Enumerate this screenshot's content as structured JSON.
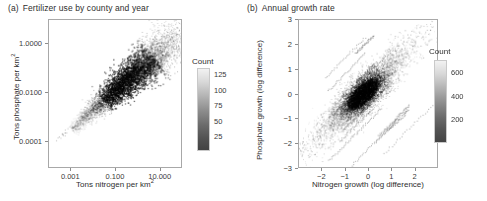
{
  "figure": {
    "width": 487,
    "height": 201,
    "background": "#ffffff",
    "ink": "#3a3a3a"
  },
  "chart_data": [
    {
      "type": "scatter",
      "panel": "a",
      "panel_tag": "(a)",
      "title": "Fertilizer use by county and year",
      "xlabel_prefix": "Tons nitrogen per km",
      "xlabel_sup": "2",
      "ylabel_prefix": "Tons phosphate per km",
      "ylabel_sup": "2",
      "xscale": "log",
      "yscale": "log",
      "xlim": [
        0.0001,
        100.0
      ],
      "ylim": [
        8e-06,
        10.0
      ],
      "xticks": [
        0.001,
        0.1,
        10.0
      ],
      "xticklabels": [
        "0.001",
        "0.100",
        "10.000"
      ],
      "yticks": [
        1.0,
        0.01,
        0.0001
      ],
      "yticklabels": [
        "1.0000",
        "0.0100",
        "0.0001"
      ],
      "grid": false,
      "legend": {
        "title": "Count",
        "position": "right",
        "ticks": [
          125,
          100,
          75,
          50,
          25
        ],
        "ticklabels": [
          "125",
          "100",
          "75",
          "50",
          "25"
        ],
        "cmin": 1,
        "cmax": 135,
        "colormap": "grey-light-to-dark"
      },
      "description": "Dense elongated point cloud along the 1:1 diagonal running from the lower-left to the upper-right of the log-log panel, widest near the upper-right, with sparse outlier streaks below the main band.",
      "cloud": {
        "x_center_frac": 0.6,
        "y_center_frac": 0.4,
        "angle_deg": -42,
        "length_frac": 1.05,
        "width_frac": 0.16,
        "n_points": 5200
      }
    },
    {
      "type": "scatter",
      "panel": "b",
      "panel_tag": "(b)",
      "title": "Annual growth rate",
      "xlabel": "Nitrogen growth (log difference)",
      "ylabel": "Phosphate growth (log difference)",
      "xscale": "linear",
      "yscale": "linear",
      "xlim": [
        -3,
        3
      ],
      "ylim": [
        -3,
        3
      ],
      "xticks": [
        -2,
        -1,
        0,
        1,
        2
      ],
      "xticklabels": [
        "−2",
        "−1",
        "0",
        "1",
        "2"
      ],
      "yticks": [
        3,
        2,
        1,
        0,
        -1,
        -2,
        -3
      ],
      "yticklabels": [
        "3",
        "2",
        "1",
        "0",
        "−1",
        "−2",
        "−3"
      ],
      "grid": false,
      "legend": {
        "title": "Count",
        "position": "right",
        "ticks": [
          600,
          400,
          200
        ],
        "ticklabels": [
          "600",
          "400",
          "200"
        ],
        "cmin": 1,
        "cmax": 700,
        "colormap": "grey-light-to-dark"
      },
      "description": "Dense dark blob centred near the origin, elongated along the 1:1 diagonal, surrounded by thin diagonal streaks of sparse points extending toward both corners.",
      "cloud": {
        "x_center_frac": 0.46,
        "y_center_frac": 0.5,
        "angle_deg": -45,
        "core_length_frac": 0.3,
        "core_width_frac": 0.13,
        "halo_length_frac": 0.95,
        "halo_width_frac": 0.09,
        "n_points": 6000
      }
    }
  ]
}
